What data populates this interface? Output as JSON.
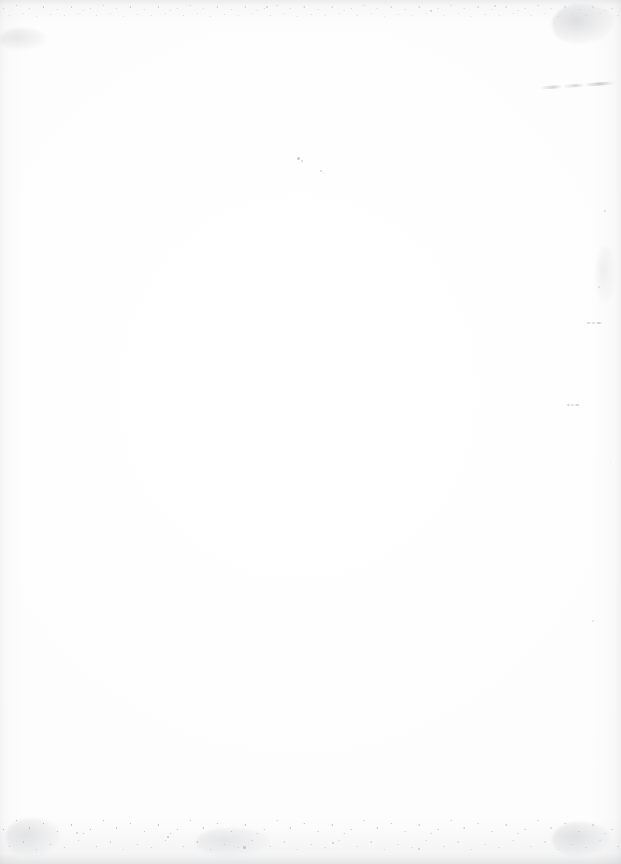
{
  "page": {
    "kind": "scanned-blank-page",
    "width": 621,
    "height": 864,
    "visible_text": "",
    "paper_color": "#fdfdfd",
    "artifact_color": "#9a9ca2",
    "edge_shadow_color": "#96989c"
  },
  "artifacts": {
    "smudges": [
      {
        "name": "top-left-smudge",
        "x": 0,
        "y": 28,
        "w": 46,
        "h": 22,
        "opacity": 0.22,
        "blur": 1.4
      },
      {
        "name": "top-right-smudge",
        "x": 552,
        "y": 4,
        "w": 62,
        "h": 40,
        "opacity": 0.3,
        "blur": 1.2
      },
      {
        "name": "bottom-right-smudge",
        "x": 552,
        "y": 822,
        "w": 58,
        "h": 34,
        "opacity": 0.26,
        "blur": 1.3
      },
      {
        "name": "bottom-left-smudge",
        "x": 6,
        "y": 818,
        "w": 54,
        "h": 38,
        "opacity": 0.24,
        "blur": 1.5
      },
      {
        "name": "bottom-center-smudge",
        "x": 196,
        "y": 828,
        "w": 74,
        "h": 28,
        "opacity": 0.2,
        "blur": 1.6
      },
      {
        "name": "right-edge-smudge",
        "x": 596,
        "y": 246,
        "w": 20,
        "h": 58,
        "opacity": 0.12,
        "blur": 1.8
      }
    ],
    "streaks": [
      {
        "name": "top-right-diagonal-streak",
        "x": 540,
        "y": 84,
        "w": 74,
        "h": 3,
        "rotate": -4
      },
      {
        "name": "right-edge-dash-1",
        "x": 586,
        "y": 322,
        "w": 16,
        "h": 2,
        "rotate": 0
      },
      {
        "name": "right-edge-dash-2",
        "x": 566,
        "y": 404,
        "w": 14,
        "h": 2,
        "rotate": 0
      }
    ],
    "specks": [
      {
        "name": "mid-speck-a",
        "x": 297,
        "y": 157,
        "size": 3.0,
        "opacity": 0.55
      },
      {
        "name": "mid-speck-b",
        "x": 301,
        "y": 160,
        "size": 2.2,
        "opacity": 0.42
      },
      {
        "name": "mid-speck-c",
        "x": 320,
        "y": 170,
        "size": 1.8,
        "opacity": 0.38
      },
      {
        "name": "mid-speck-d",
        "x": 322,
        "y": 173,
        "size": 1.4,
        "opacity": 0.3
      },
      {
        "name": "right-speck-a",
        "x": 604,
        "y": 210,
        "size": 1.6,
        "opacity": 0.3
      },
      {
        "name": "right-speck-b",
        "x": 598,
        "y": 286,
        "size": 1.5,
        "opacity": 0.28
      },
      {
        "name": "right-speck-c",
        "x": 610,
        "y": 462,
        "size": 1.4,
        "opacity": 0.26
      },
      {
        "name": "right-speck-d",
        "x": 592,
        "y": 620,
        "size": 1.5,
        "opacity": 0.24
      },
      {
        "name": "bottom-speck-a",
        "x": 167,
        "y": 836,
        "size": 2.4,
        "opacity": 0.52
      },
      {
        "name": "bottom-speck-b",
        "x": 243,
        "y": 846,
        "size": 2.6,
        "opacity": 0.48
      },
      {
        "name": "bottom-speck-c",
        "x": 332,
        "y": 842,
        "size": 2.0,
        "opacity": 0.44
      },
      {
        "name": "bottom-speck-d",
        "x": 418,
        "y": 848,
        "size": 1.8,
        "opacity": 0.4
      },
      {
        "name": "bottom-speck-e",
        "x": 76,
        "y": 832,
        "size": 2.2,
        "opacity": 0.46
      },
      {
        "name": "top-speck-a",
        "x": 266,
        "y": 6,
        "size": 2.0,
        "opacity": 0.4
      },
      {
        "name": "top-speck-b",
        "x": 430,
        "y": 10,
        "size": 1.6,
        "opacity": 0.34
      },
      {
        "name": "top-speck-c",
        "x": 494,
        "y": 5,
        "size": 1.8,
        "opacity": 0.36
      }
    ],
    "dust_bands": [
      {
        "name": "top-dust-band",
        "x": 0,
        "y": 0,
        "w": 621,
        "h": 22,
        "opacity": 0.55
      },
      {
        "name": "bottom-dust-band",
        "x": 0,
        "y": 806,
        "w": 621,
        "h": 58,
        "opacity": 0.8
      }
    ]
  }
}
